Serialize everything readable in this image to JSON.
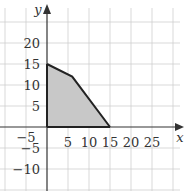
{
  "chart_data": {
    "type": "area",
    "title": "",
    "xlabel": "x",
    "ylabel": "y",
    "xlim": [
      -10,
      30
    ],
    "ylim": [
      -15,
      25
    ],
    "grid": true,
    "x_ticks": [
      -5,
      5,
      10,
      15,
      20,
      25
    ],
    "y_ticks": [
      20,
      15,
      10,
      5,
      -5,
      -10
    ],
    "x_tick_labels": [
      "−5",
      "5",
      "10",
      "15",
      "20",
      "25"
    ],
    "y_tick_labels": [
      "20",
      "15",
      "10",
      "5",
      "−5",
      "−10"
    ],
    "feasible_region": {
      "vertices": [
        [
          0,
          0
        ],
        [
          0,
          15
        ],
        [
          6,
          12
        ],
        [
          15,
          0
        ]
      ],
      "fill": "#c8c8c8",
      "stroke": "#222222"
    }
  }
}
